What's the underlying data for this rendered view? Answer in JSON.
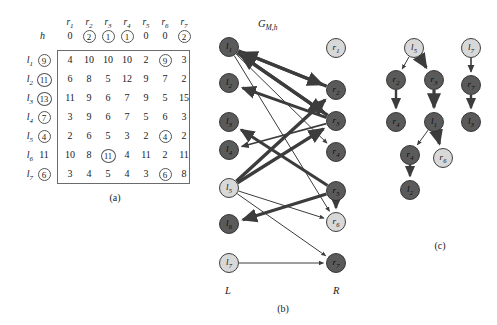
{
  "figure": {
    "panels": [
      {
        "id": "a",
        "caption": "(a)"
      },
      {
        "id": "b",
        "caption": "(b)"
      },
      {
        "id": "c",
        "caption": "(c)"
      }
    ]
  },
  "table": {
    "column_headers": [
      "r1",
      "r2",
      "r3",
      "r4",
      "r5",
      "r6",
      "r7"
    ],
    "column_headers_display": [
      {
        "base": "r",
        "sub": "1"
      },
      {
        "base": "r",
        "sub": "2"
      },
      {
        "base": "r",
        "sub": "3"
      },
      {
        "base": "r",
        "sub": "4"
      },
      {
        "base": "r",
        "sub": "5"
      },
      {
        "base": "r",
        "sub": "6"
      },
      {
        "base": "r",
        "sub": "7"
      }
    ],
    "h_label": "h",
    "h_values": [
      "0",
      "2",
      "1",
      "1",
      "0",
      "0",
      "2"
    ],
    "h_circled": [
      false,
      true,
      true,
      true,
      false,
      false,
      true
    ],
    "row_labels": [
      {
        "base": "l",
        "sub": "1"
      },
      {
        "base": "l",
        "sub": "2"
      },
      {
        "base": "l",
        "sub": "3"
      },
      {
        "base": "l",
        "sub": "4"
      },
      {
        "base": "l",
        "sub": "5"
      },
      {
        "base": "l",
        "sub": "6"
      },
      {
        "base": "l",
        "sub": "7"
      }
    ],
    "row_values": [
      "9",
      "11",
      "13",
      "7",
      "4",
      "11",
      "6"
    ],
    "row_circled": [
      true,
      true,
      true,
      true,
      true,
      false,
      true
    ],
    "cells": [
      [
        "4",
        "10",
        "10",
        "10",
        "2",
        "9",
        "3"
      ],
      [
        "6",
        "8",
        "5",
        "12",
        "9",
        "7",
        "2"
      ],
      [
        "11",
        "9",
        "6",
        "7",
        "9",
        "5",
        "15"
      ],
      [
        "3",
        "9",
        "6",
        "7",
        "5",
        "6",
        "3"
      ],
      [
        "2",
        "6",
        "5",
        "3",
        "2",
        "4",
        "2"
      ],
      [
        "10",
        "8",
        "11",
        "4",
        "11",
        "2",
        "11"
      ],
      [
        "3",
        "4",
        "5",
        "4",
        "3",
        "6",
        "8"
      ]
    ],
    "cells_circled": [
      [
        false,
        false,
        false,
        false,
        false,
        true,
        false
      ],
      [
        false,
        false,
        false,
        false,
        false,
        false,
        false
      ],
      [
        false,
        false,
        false,
        false,
        false,
        false,
        false
      ],
      [
        false,
        false,
        false,
        false,
        false,
        false,
        false
      ],
      [
        false,
        false,
        false,
        false,
        false,
        true,
        false
      ],
      [
        false,
        false,
        true,
        false,
        false,
        false,
        false
      ],
      [
        false,
        false,
        false,
        false,
        false,
        true,
        false
      ]
    ]
  },
  "graph_b": {
    "title_base": "G",
    "title_sub": "M,h",
    "side_label_left": "L",
    "side_label_right": "R",
    "left_nodes": [
      {
        "id": "l1",
        "base": "l",
        "sub": "1",
        "shade": "dark",
        "x": 229,
        "y": 47
      },
      {
        "id": "l2",
        "base": "l",
        "sub": "2",
        "shade": "dark",
        "x": 229,
        "y": 83
      },
      {
        "id": "l3",
        "base": "l",
        "sub": "3",
        "shade": "dark",
        "x": 229,
        "y": 122
      },
      {
        "id": "l4",
        "base": "l",
        "sub": "4",
        "shade": "dark",
        "x": 229,
        "y": 150
      },
      {
        "id": "l5",
        "base": "l",
        "sub": "5",
        "shade": "light",
        "x": 229,
        "y": 188
      },
      {
        "id": "l6",
        "base": "l",
        "sub": "6",
        "shade": "dark",
        "x": 229,
        "y": 224
      },
      {
        "id": "l7",
        "base": "l",
        "sub": "7",
        "shade": "light",
        "x": 229,
        "y": 263
      }
    ],
    "right_nodes": [
      {
        "id": "r1",
        "base": "r",
        "sub": "1",
        "shade": "light",
        "x": 336,
        "y": 48
      },
      {
        "id": "r2",
        "base": "r",
        "sub": "2",
        "shade": "dark",
        "x": 336,
        "y": 90
      },
      {
        "id": "r3",
        "base": "r",
        "sub": "3",
        "shade": "dark",
        "x": 336,
        "y": 121
      },
      {
        "id": "r4",
        "base": "r",
        "sub": "4",
        "shade": "dark",
        "x": 336,
        "y": 152
      },
      {
        "id": "r5",
        "base": "r",
        "sub": "5",
        "shade": "dark",
        "x": 336,
        "y": 191
      },
      {
        "id": "r6",
        "base": "r",
        "sub": "6",
        "shade": "light",
        "x": 336,
        "y": 222
      },
      {
        "id": "r7",
        "base": "r",
        "sub": "7",
        "shade": "dark",
        "x": 336,
        "y": 263
      }
    ],
    "edges": [
      {
        "from": "l1",
        "to": "r2",
        "width": 3.4,
        "dir": "forward"
      },
      {
        "from": "l1",
        "to": "r3",
        "width": 3.4,
        "dir": "forward"
      },
      {
        "from": "l1",
        "to": "r4",
        "width": 1.0,
        "dir": "forward"
      },
      {
        "from": "l1",
        "to": "r6",
        "width": 1.0,
        "dir": "forward"
      },
      {
        "from": "r3",
        "to": "l1",
        "width": 3.4,
        "dir": "forward"
      },
      {
        "from": "r2",
        "to": "l1",
        "width": 3.4,
        "dir": "forward"
      },
      {
        "from": "r3",
        "to": "l2",
        "width": 3.0,
        "dir": "forward"
      },
      {
        "from": "r5",
        "to": "l3",
        "width": 3.0,
        "dir": "forward"
      },
      {
        "from": "r3",
        "to": "l4",
        "width": 1.6,
        "dir": "forward"
      },
      {
        "from": "l5",
        "to": "r2",
        "width": 3.4,
        "dir": "forward"
      },
      {
        "from": "l5",
        "to": "r3",
        "width": 3.4,
        "dir": "forward"
      },
      {
        "from": "l5",
        "to": "r6",
        "width": 1.0,
        "dir": "forward"
      },
      {
        "from": "l5",
        "to": "r7",
        "width": 1.0,
        "dir": "forward"
      },
      {
        "from": "r5",
        "to": "l6",
        "width": 3.2,
        "dir": "forward"
      },
      {
        "from": "l7",
        "to": "r7",
        "width": 1.0,
        "dir": "forward"
      },
      {
        "from": "r5",
        "to": "r6",
        "width": 2.6,
        "dir": "forward"
      }
    ]
  },
  "graph_c": {
    "nodes": [
      {
        "id": "c_l5",
        "base": "l",
        "sub": "5",
        "shade": "light",
        "x": 414,
        "y": 48
      },
      {
        "id": "c_r2",
        "base": "r",
        "sub": "2",
        "shade": "dark",
        "x": 396,
        "y": 80
      },
      {
        "id": "c_r3",
        "base": "r",
        "sub": "3",
        "shade": "dark",
        "x": 434,
        "y": 80
      },
      {
        "id": "c_r4",
        "base": "r",
        "sub": "4",
        "shade": "dark",
        "x": 396,
        "y": 122
      },
      {
        "id": "c_l1",
        "base": "l",
        "sub": "1",
        "shade": "dark",
        "x": 434,
        "y": 122
      },
      {
        "id": "c_r4b",
        "base": "r",
        "sub": "4",
        "shade": "dark",
        "x": 410,
        "y": 155
      },
      {
        "id": "c_r6",
        "base": "r",
        "sub": "6",
        "shade": "light",
        "x": 443,
        "y": 158
      },
      {
        "id": "c_l2",
        "base": "l",
        "sub": "2",
        "shade": "dark",
        "x": 410,
        "y": 190
      },
      {
        "id": "c_l7",
        "base": "l",
        "sub": "7",
        "shade": "light",
        "x": 471,
        "y": 48
      },
      {
        "id": "c_r7",
        "base": "r",
        "sub": "7",
        "shade": "dark",
        "x": 471,
        "y": 85
      },
      {
        "id": "c_l3",
        "base": "l",
        "sub": "3",
        "shade": "dark",
        "x": 471,
        "y": 122
      }
    ],
    "edges": [
      {
        "from": "c_l5",
        "to": "c_r2",
        "width": 1.0
      },
      {
        "from": "c_l5",
        "to": "c_r3",
        "width": 3.2
      },
      {
        "from": "c_r2",
        "to": "c_r4",
        "width": 2.4
      },
      {
        "from": "c_r3",
        "to": "c_l1",
        "width": 3.2
      },
      {
        "from": "c_l1",
        "to": "c_r4b",
        "width": 1.0
      },
      {
        "from": "c_l1",
        "to": "c_r6",
        "width": 3.2
      },
      {
        "from": "c_r4b",
        "to": "c_l2",
        "width": 2.4
      },
      {
        "from": "c_l7",
        "to": "c_r7",
        "width": 1.6
      },
      {
        "from": "c_r7",
        "to": "c_l3",
        "width": 2.4
      }
    ]
  },
  "colors": {
    "node_dark": "#5a5a5a",
    "node_light": "#d8d8d8",
    "node_stroke": "#2b2b2b",
    "edge": "#3c3c3c",
    "table_border": "#6b6b6b",
    "background": "#ffffff"
  }
}
